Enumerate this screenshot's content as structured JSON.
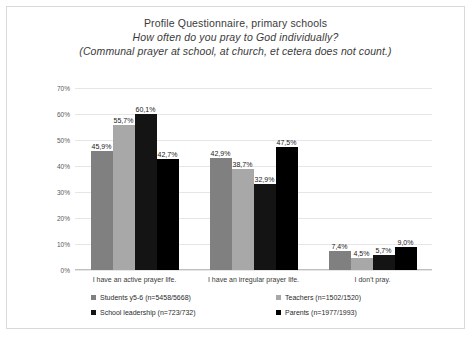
{
  "chart_data": {
    "type": "bar",
    "title": "Profile Questionnaire, primary schools",
    "subtitle": "How often do you pray to God individually?",
    "subtitle2": "(Communal prayer at school, at church, et cetera does not count.)",
    "xlabel": "",
    "ylabel": "",
    "ylim": [
      0,
      70
    ],
    "grid": true,
    "legend_position": "bottom",
    "ytick_labels": [
      "70%",
      "60%",
      "50%",
      "40%",
      "30%",
      "20%",
      "10%",
      "0%"
    ],
    "ytick_values": [
      70,
      60,
      50,
      40,
      30,
      20,
      10,
      0
    ],
    "categories": [
      "I have an active prayer life.",
      "I have an irregular prayer life.",
      "I don't pray."
    ],
    "series": [
      {
        "name": "Students y5-6 (n=5458/5668)",
        "color": "#808080",
        "values": [
          45.9,
          42.9,
          7.4
        ],
        "labels": [
          "45,9%",
          "42,9%",
          "7,4%"
        ]
      },
      {
        "name": "Teachers (n=1502/1520)",
        "color": "#a8a8a8",
        "values": [
          55.7,
          38.7,
          4.5
        ],
        "labels": [
          "55,7%",
          "38,7%",
          "4,5%"
        ]
      },
      {
        "name": "School leadership (n=723/732)",
        "color": "#141414",
        "values": [
          60.1,
          32.9,
          5.7
        ],
        "labels": [
          "60,1%",
          "32,9%",
          "5,7%"
        ]
      },
      {
        "name": "Parents (n=1977/1993)",
        "color": "#000000",
        "values": [
          42.7,
          47.5,
          9.0
        ],
        "labels": [
          "42,7%",
          "47,5%",
          "9,0%"
        ]
      }
    ]
  }
}
